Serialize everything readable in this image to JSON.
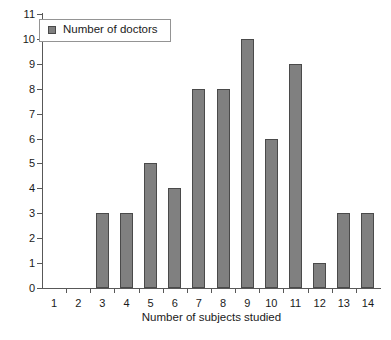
{
  "chart_data": {
    "type": "bar",
    "title": "",
    "subtitle": "",
    "xlabel": "Number of subjects studied",
    "ylabel": "",
    "categories": [
      "1",
      "2",
      "3",
      "4",
      "5",
      "6",
      "7",
      "8",
      "9",
      "10",
      "11",
      "12",
      "13",
      "14"
    ],
    "values": [
      0,
      0,
      3,
      3,
      5,
      4,
      8,
      8,
      10,
      6,
      9,
      1,
      3,
      3
    ],
    "series": [
      {
        "name": "Number of doctors",
        "values": [
          0,
          0,
          3,
          3,
          5,
          4,
          8,
          8,
          10,
          6,
          9,
          1,
          3,
          3
        ]
      }
    ],
    "ylim": [
      0,
      11
    ],
    "ytick_step": 1,
    "yticks": [
      "0",
      "1",
      "2",
      "3",
      "4",
      "5",
      "6",
      "7",
      "8",
      "9",
      "10",
      "11"
    ],
    "xlim_categories": [
      1,
      14
    ],
    "grid": false,
    "legend": {
      "position": "top-left",
      "entries": [
        {
          "label": "Number of doctors",
          "color": "#808080"
        }
      ]
    },
    "colors": {
      "bar_fill": "#808080",
      "bar_edge": "#4a4a4a",
      "axis": "#585858",
      "text": "#1a1a1a",
      "background": "#ffffff"
    }
  }
}
